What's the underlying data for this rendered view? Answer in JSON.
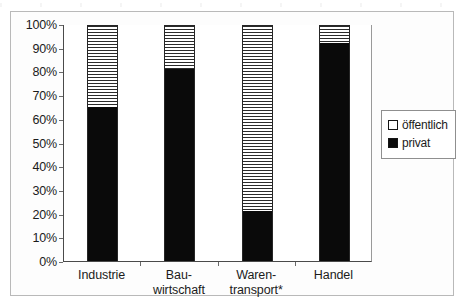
{
  "chart_data": {
    "type": "bar",
    "subtype": "100% stacked bar",
    "title": "",
    "subtitle": "",
    "xlabel": "",
    "ylabel": "",
    "categories": [
      "Industrie",
      "Bau-\nwirtschaft",
      "Waren-\ntransport*",
      "Handel"
    ],
    "category_lines": [
      [
        "Industrie"
      ],
      [
        "Bau-",
        "wirtschaft"
      ],
      [
        "Waren-",
        "transport*"
      ],
      [
        "Handel"
      ]
    ],
    "series": [
      {
        "name": "privat",
        "values": [
          65,
          81,
          21,
          92
        ],
        "color": "#0a0a0a",
        "fill": "solid"
      },
      {
        "name": "öffentlich",
        "values": [
          35,
          19,
          79,
          8
        ],
        "color": "#ffffff",
        "fill": "horizontal-hatch"
      }
    ],
    "ylim": [
      0,
      100
    ],
    "ytick_values": [
      0,
      10,
      20,
      30,
      40,
      50,
      60,
      70,
      80,
      90,
      100
    ],
    "ytick_labels": [
      "0%",
      "10%",
      "20%",
      "30%",
      "40%",
      "50%",
      "60%",
      "70%",
      "80%",
      "90%",
      "100%"
    ],
    "grid": false,
    "legend_position": "right",
    "footnote_marker": "*"
  },
  "legend": {
    "items": [
      {
        "label": "öffentlich",
        "swatch": "hatched-square-icon"
      },
      {
        "label": "privat",
        "swatch": "black-square-icon"
      }
    ]
  },
  "colors": {
    "privat": "#0a0a0a",
    "oeffentlich": "#ffffff",
    "bar_outline": "#262626",
    "axis": "#4a4a4a",
    "frame": "#b9b9b9",
    "text": "#1b1b1b"
  }
}
